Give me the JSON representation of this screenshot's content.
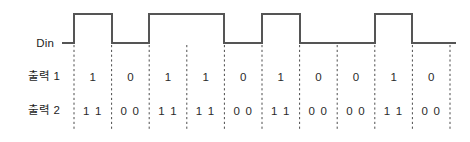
{
  "figure": {
    "width": 470,
    "height": 142,
    "background_color": "#ffffff"
  },
  "labels": {
    "din": "Din",
    "output1": "출력 1",
    "output2": "출력 2"
  },
  "colors": {
    "waveform": "#555555",
    "gridline": "#4d4d4d",
    "text": "#1d1d1d"
  },
  "chart_data": {
    "type": "line",
    "xlabel": "",
    "ylabel": "",
    "grid": true,
    "legend_position": "left-labels",
    "slot_count": 10,
    "slot_x_start": 74,
    "slot_width": 37.6,
    "signal_high_y": 14,
    "signal_low_y": 43,
    "gridline_x": [
      74,
      111.6,
      149.2,
      186.8,
      224.4,
      262,
      299.6,
      337.2,
      374.8,
      412.4,
      450
    ],
    "series": [
      {
        "name": "Din",
        "type": "square-wave",
        "levels": [
          1,
          0,
          1,
          1,
          0,
          1,
          0,
          0,
          1,
          0
        ],
        "lead_in_level": 0,
        "lead_in_x": [
          62,
          74
        ],
        "lead_out_level": 0,
        "lead_out_x": [
          450,
          456
        ]
      },
      {
        "name": "출력 1",
        "type": "bit-labels",
        "values": [
          "1",
          "0",
          "1",
          "1",
          "0",
          "1",
          "0",
          "0",
          "1",
          "0"
        ]
      },
      {
        "name": "출력 2",
        "type": "bit-labels",
        "values": [
          "1 1",
          "0 0",
          "1 1",
          "1 1",
          "0 0",
          "1 1",
          "0 0",
          "0 0",
          "1 1",
          "0 0"
        ]
      }
    ]
  }
}
